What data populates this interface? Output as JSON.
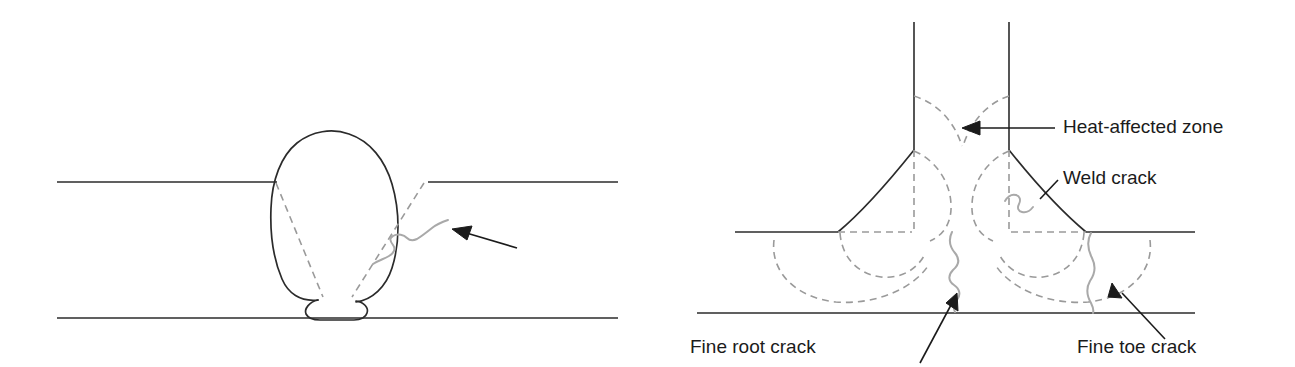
{
  "figure": {
    "background_color": "#ffffff",
    "width": 1295,
    "height": 367
  },
  "colors": {
    "plate_line": "#2b2b2b",
    "weld_outline": "#2b2b2b",
    "dashed_fusion_line": "#9a9a9a",
    "haz_dashed": "#9a9a9a",
    "crack_line": "#a9a9a9",
    "arrow": "#1b1b1b",
    "text": "#1b1b1b"
  },
  "left_diagram": {
    "name": "butt-weld-cross-section",
    "description": "Butt weld between two plates with a fine crack in the weld metal",
    "plates": {
      "top_surface_label": "top plate surface",
      "bottom_surface_label": "bottom plate surface"
    },
    "features": [
      "weld bead outline",
      "dashed fusion boundary left",
      "dashed fusion boundary right",
      "root penetration bead",
      "fine crack"
    ],
    "callout": {
      "label": "",
      "arrow_points_to": "fine crack in weld metal"
    }
  },
  "right_diagram": {
    "name": "fillet-weld-cross-section",
    "description": "Double fillet weld at a tee joint showing heat-affected zones and cracks",
    "features": [
      "vertical member left face",
      "vertical member right face",
      "left fillet weld face",
      "right fillet weld face",
      "heat-affected zone boundaries",
      "weld crack",
      "fine root crack",
      "fine toe crack"
    ],
    "labels": [
      {
        "id": "heat-affected-zone",
        "text": "Heat-affected zone",
        "x": 1063,
        "y": 133,
        "anchor": "start",
        "has_leader": true
      },
      {
        "id": "weld-crack",
        "text": "Weld crack",
        "x": 1063,
        "y": 184,
        "anchor": "start",
        "has_leader": false
      },
      {
        "id": "fine-root-crack",
        "text": "Fine root crack",
        "x": 690,
        "y": 353,
        "anchor": "start",
        "has_leader": true
      },
      {
        "id": "fine-toe-crack",
        "text": "Fine toe crack",
        "x": 1077,
        "y": 353,
        "anchor": "start",
        "has_leader": true
      }
    ]
  }
}
